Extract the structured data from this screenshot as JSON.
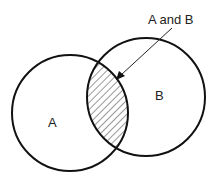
{
  "diagram": {
    "type": "venn",
    "sets": [
      {
        "label": "A",
        "cx": 70,
        "cy": 113,
        "r": 58
      },
      {
        "label": "B",
        "cx": 146,
        "cy": 97,
        "r": 59
      }
    ],
    "intersection_label": "A and B",
    "colors": {
      "stroke": "#111111",
      "hatch": "#333333",
      "background": "#ffffff"
    }
  }
}
